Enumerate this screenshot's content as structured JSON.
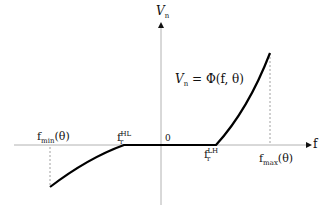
{
  "diagram": {
    "type": "piecewise-function-plot",
    "axes": {
      "y_label": "V",
      "y_label_sub": "n",
      "x_label": "f",
      "origin_label": "0"
    },
    "equation": {
      "lhs": "V",
      "lhs_sub": "n",
      "rhs": "= Φ(f, θ)"
    },
    "markers": {
      "f_min": {
        "base": "f",
        "sub": "min",
        "arg": "(θ)"
      },
      "f_HL": {
        "base": "f",
        "sub": "r",
        "sup": "HL"
      },
      "f_LH": {
        "base": "f",
        "sub": "r",
        "sup": "LH"
      },
      "f_max": {
        "base": "f",
        "sub": "max",
        "arg": "(θ)"
      }
    },
    "colors": {
      "curve": "#000000",
      "axis": "#999999",
      "dashed": "#888888"
    }
  }
}
